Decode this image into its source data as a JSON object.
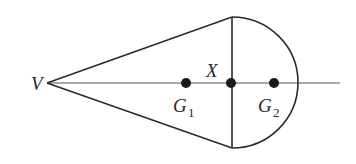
{
  "diagram": {
    "type": "geometry-figure",
    "colors": {
      "stroke": "#2a2a2a",
      "axis": "#555555",
      "background": "#ffffff"
    },
    "labels": {
      "vertex": "V",
      "junction": "X",
      "g1_main": "G",
      "g1_sub": "1",
      "g2_main": "G",
      "g2_sub": "2"
    },
    "points": [
      {
        "name": "V",
        "role": "cone apex"
      },
      {
        "name": "G1",
        "role": "centre of mass of cone"
      },
      {
        "name": "X",
        "role": "centre of common plane face"
      },
      {
        "name": "G2",
        "role": "centre of mass of hemisphere"
      }
    ]
  }
}
